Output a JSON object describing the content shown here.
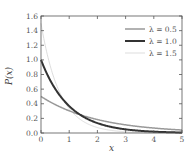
{
  "chart_data": {
    "type": "line",
    "title": "",
    "xlabel": "x",
    "ylabel": "P(x)",
    "xlim": [
      0,
      5
    ],
    "ylim": [
      0,
      1.6
    ],
    "xticks": [
      "0",
      "1",
      "2",
      "3",
      "4",
      "5"
    ],
    "yticks": [
      "0.0",
      "0.2",
      "0.4",
      "0.6",
      "0.8",
      "1.0",
      "1.2",
      "1.4",
      "1.6"
    ],
    "grid": false,
    "legend_position": "upper right",
    "function": "lambda * exp(-lambda * x)",
    "series": [
      {
        "name": "λ = 0.5",
        "lambda": 0.5,
        "color": "#999999",
        "width": 1.5,
        "x": [
          0,
          0.5,
          1,
          1.5,
          2,
          2.5,
          3,
          3.5,
          4,
          4.5,
          5
        ],
        "values": [
          0.5,
          0.389,
          0.303,
          0.236,
          0.184,
          0.143,
          0.112,
          0.087,
          0.068,
          0.053,
          0.041
        ]
      },
      {
        "name": "λ = 1.0",
        "lambda": 1.0,
        "color": "#333333",
        "width": 2,
        "x": [
          0,
          0.5,
          1,
          1.5,
          2,
          2.5,
          3,
          3.5,
          4,
          4.5,
          5
        ],
        "values": [
          1.0,
          0.607,
          0.368,
          0.223,
          0.135,
          0.082,
          0.05,
          0.03,
          0.018,
          0.011,
          0.007
        ]
      },
      {
        "name": "λ = 1.5",
        "lambda": 1.5,
        "color": "#dddddd",
        "width": 1,
        "x": [
          0,
          0.5,
          1,
          1.5,
          2,
          2.5,
          3,
          3.5,
          4,
          4.5,
          5
        ],
        "values": [
          1.5,
          0.709,
          0.335,
          0.158,
          0.075,
          0.035,
          0.017,
          0.008,
          0.004,
          0.002,
          0.001
        ]
      }
    ]
  }
}
